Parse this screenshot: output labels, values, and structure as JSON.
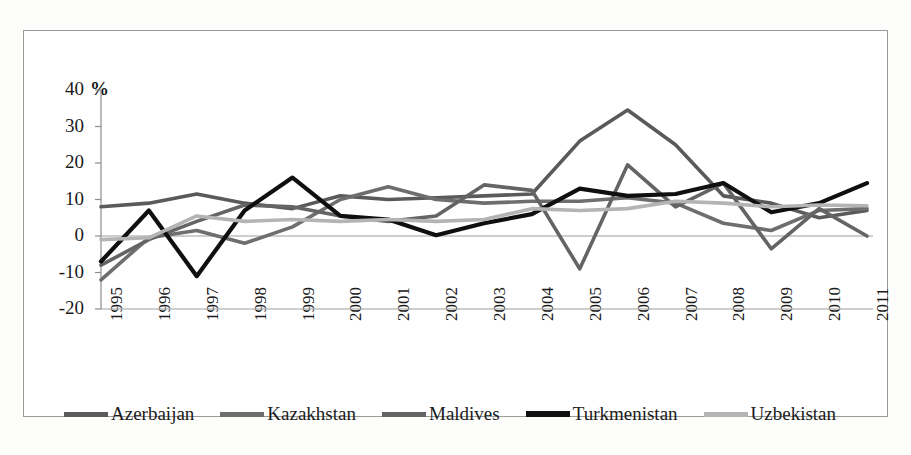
{
  "chart_data": {
    "type": "line",
    "title": "",
    "subtitle": "",
    "xlabel": "",
    "ylabel": "%",
    "unit_label": "%",
    "categories": [
      "1995",
      "1996",
      "1997",
      "1998",
      "1999",
      "2000",
      "2001",
      "2002",
      "2003",
      "2004",
      "2005",
      "2006",
      "2007",
      "2008",
      "2009",
      "2010",
      "2011"
    ],
    "x": [
      1995,
      1996,
      1997,
      1998,
      1999,
      2000,
      2001,
      2002,
      2003,
      2004,
      2005,
      2006,
      2007,
      2008,
      2009,
      2010,
      2011
    ],
    "ylim": [
      -20,
      40
    ],
    "yticks": [
      40,
      30,
      20,
      10,
      0,
      -10,
      -20
    ],
    "ytick_labels": [
      "40",
      "30",
      "20",
      "10",
      "0",
      "-10",
      "-20"
    ],
    "grid": false,
    "zero_line": true,
    "legend_position": "bottom",
    "series": [
      {
        "name": "Azerbaijan",
        "color": "#5a5a5a",
        "values": [
          8,
          9,
          11.5,
          9,
          7.5,
          11,
          10,
          10.5,
          11,
          11.5,
          26,
          34.5,
          25,
          11,
          9,
          5,
          7
        ]
      },
      {
        "name": "Kazakhstan",
        "color": "#6e6e6e",
        "values": [
          -12,
          -0.5,
          1.5,
          -2,
          2.5,
          10,
          13.5,
          10,
          9,
          9.5,
          9.5,
          10.5,
          9,
          3.5,
          1.5,
          7,
          7.5
        ]
      },
      {
        "name": "Maldives",
        "color": "#646464",
        "values": [
          -8,
          -1,
          4,
          8.5,
          8,
          5.5,
          4,
          5.5,
          14,
          12.5,
          -9,
          19.5,
          8,
          14.5,
          -3.5,
          7.5,
          0
        ]
      },
      {
        "name": "Turkmenistan",
        "color": "#0f0f0f",
        "values": [
          -7,
          7,
          -11,
          7,
          16,
          5.5,
          4.5,
          0.2,
          3.5,
          6,
          13,
          11,
          11.5,
          14.5,
          6.5,
          9,
          14.5
        ]
      },
      {
        "name": "Uzbekistan",
        "color": "#b4b4b4",
        "values": [
          -1,
          -0.5,
          5.5,
          4,
          4.5,
          4,
          4.5,
          4,
          4.5,
          7.5,
          7,
          7.5,
          9.5,
          9,
          8,
          8.5,
          8.3
        ]
      }
    ]
  },
  "legend": {
    "items": [
      {
        "label": "Azerbaijan"
      },
      {
        "label": "Kazakhstan"
      },
      {
        "label": "Maldives"
      },
      {
        "label": "Turkmenistan"
      },
      {
        "label": "Uzbekistan"
      }
    ]
  }
}
